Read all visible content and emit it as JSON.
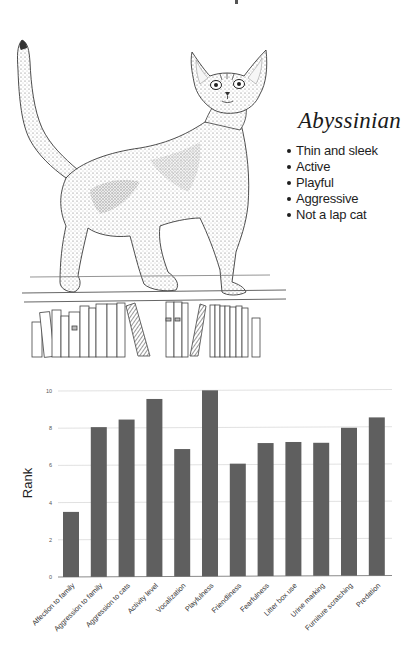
{
  "breed": {
    "name": "Abyssinian",
    "traits": [
      "Thin and sleek",
      "Active",
      "Playful",
      "Aggressive",
      "Not a lap cat"
    ]
  },
  "illustration": {
    "subject": "Abyssinian cat standing on a bookshelf",
    "style": "pen-and-ink stipple drawing"
  },
  "chart_data": {
    "type": "bar",
    "title": "",
    "xlabel": "",
    "ylabel": "Rank",
    "ylim": [
      0,
      10
    ],
    "yticks": [
      0,
      2,
      4,
      6,
      8,
      10
    ],
    "grid": true,
    "legend": null,
    "bar_color": "#5f5f5f",
    "categories": [
      "Affection to family",
      "Aggression to family",
      "Aggression to cats",
      "Activity level",
      "Vocalization",
      "Playfulness",
      "Friendliness",
      "Fearfulness",
      "Litter box use",
      "Urine marking",
      "Furniture scratching",
      "Predation"
    ],
    "values": [
      3.5,
      8.05,
      8.45,
      9.55,
      6.85,
      10.0,
      6.05,
      7.15,
      7.2,
      7.15,
      7.95,
      8.5
    ]
  }
}
